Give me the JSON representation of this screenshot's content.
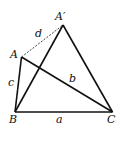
{
  "diagram": {
    "points": {
      "A": {
        "label": "A",
        "x": 21.5,
        "y": 57
      },
      "A_prime": {
        "label": "A′",
        "x": 63,
        "y": 25
      },
      "B": {
        "label": "B",
        "x": 15,
        "y": 112
      },
      "C": {
        "label": "C",
        "x": 112.5,
        "y": 112
      }
    },
    "segments": [
      {
        "from": "A",
        "to": "B",
        "label": "c",
        "style": "solid"
      },
      {
        "from": "A",
        "to": "C",
        "label": "b",
        "style": "solid"
      },
      {
        "from": "B",
        "to": "C",
        "label": "a",
        "style": "solid"
      },
      {
        "from": "B",
        "to": "A_prime",
        "label": "",
        "style": "solid"
      },
      {
        "from": "A_prime",
        "to": "C",
        "label": "",
        "style": "solid"
      },
      {
        "from": "A",
        "to": "A_prime",
        "label": "d",
        "style": "dashed"
      }
    ],
    "labels": {
      "A": "A",
      "A_prime": "A′",
      "B": "B",
      "C": "C",
      "a": "a",
      "b": "b",
      "c": "c",
      "d": "d"
    },
    "colors": {
      "stroke": "#111111",
      "background": "#ffffff"
    }
  }
}
